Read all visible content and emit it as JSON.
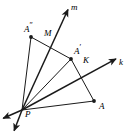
{
  "figure": {
    "width": 129,
    "height": 136,
    "background_color": "#ffffff",
    "stroke_color": "#1a1a1a"
  },
  "points": [
    {
      "id": "P",
      "label": "P",
      "prime": "",
      "x": 22,
      "y": 110,
      "label_x": 25,
      "label_y": 113,
      "dot": false
    },
    {
      "id": "A",
      "label": "A",
      "prime": "",
      "x": 94,
      "y": 101,
      "label_x": 99,
      "label_y": 106,
      "dot": true
    },
    {
      "id": "Aprime",
      "label": "A",
      "prime": "′",
      "x": 71,
      "y": 59,
      "label_x": 74,
      "label_y": 48,
      "dot": true
    },
    {
      "id": "Adprime",
      "label": "A",
      "prime": "″",
      "x": 31,
      "y": 37,
      "label_x": 25,
      "label_y": 26,
      "dot": true
    },
    {
      "id": "M",
      "label": "M",
      "prime": "",
      "x": 53,
      "y": 39,
      "label_x": 45,
      "label_y": 35,
      "dot": false
    },
    {
      "id": "K",
      "label": "K",
      "prime": "",
      "x": 87,
      "y": 71,
      "label_x": 84,
      "label_y": 61,
      "dot": false
    }
  ],
  "rays": [
    {
      "id": "ray-m",
      "label": "m",
      "label_x": 71,
      "label_y": 6,
      "from": "P",
      "tip_x": 68,
      "tip_y": 8
    },
    {
      "id": "ray-k",
      "label": "k",
      "label_x": 119,
      "label_y": 62,
      "from": "P",
      "tip_x": 117,
      "tip_y": 58
    }
  ],
  "segments": [
    {
      "id": "seg-P-Adprime",
      "from": "P",
      "to": "A″"
    },
    {
      "id": "seg-P-Aprime",
      "from": "P",
      "to": "A′"
    },
    {
      "id": "seg-P-A",
      "from": "P",
      "to": "A"
    },
    {
      "id": "seg-Adprime-Aprime",
      "from": "A″",
      "to": "A′"
    },
    {
      "id": "seg-Aprime-A",
      "from": "A′",
      "to": "A"
    }
  ],
  "extra_arrows": [
    {
      "id": "arrow-lower-left-1",
      "tip_x": 2,
      "tip_y": 119
    },
    {
      "id": "arrow-lower-left-2",
      "tip_x": 13,
      "tip_y": 132
    }
  ]
}
